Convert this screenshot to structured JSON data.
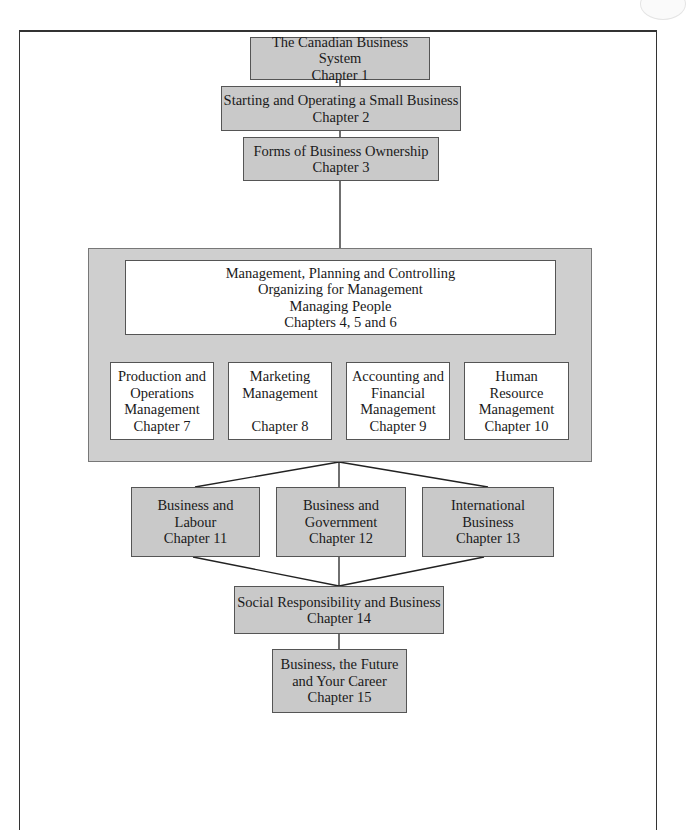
{
  "diagram": {
    "type": "flowchart",
    "nodes": [
      {
        "id": "ch1",
        "lines": [
          "The Canadian Business System",
          "Chapter 1"
        ]
      },
      {
        "id": "ch2",
        "lines": [
          "Starting and Operating a Small Business",
          "Chapter 2"
        ]
      },
      {
        "id": "ch3",
        "lines": [
          "Forms of Business Ownership",
          "Chapter 3"
        ]
      },
      {
        "id": "ch456",
        "lines": [
          "Management, Planning and Controlling",
          "Organizing for Management",
          "Managing People",
          "Chapters 4, 5 and 6"
        ]
      },
      {
        "id": "ch7",
        "lines": [
          "Production and",
          "Operations",
          "Management",
          "Chapter 7"
        ]
      },
      {
        "id": "ch8",
        "lines": [
          "Marketing",
          "Management",
          "",
          "Chapter 8"
        ]
      },
      {
        "id": "ch9",
        "lines": [
          "Accounting and",
          "Financial",
          "Management",
          "Chapter 9"
        ]
      },
      {
        "id": "ch10",
        "lines": [
          "Human",
          "Resource",
          "Management",
          "Chapter 10"
        ]
      },
      {
        "id": "ch11",
        "lines": [
          "Business and",
          "Labour",
          "Chapter 11"
        ]
      },
      {
        "id": "ch12",
        "lines": [
          "Business and",
          "Government",
          "Chapter 12"
        ]
      },
      {
        "id": "ch13",
        "lines": [
          "International",
          "Business",
          "Chapter 13"
        ]
      },
      {
        "id": "ch14",
        "lines": [
          "Social Responsibility and Business",
          "Chapter 14"
        ]
      },
      {
        "id": "ch15",
        "lines": [
          "Business, the Future",
          "and Your Career",
          "Chapter 15"
        ]
      }
    ],
    "edges": [
      [
        "ch1",
        "ch2"
      ],
      [
        "ch2",
        "ch3"
      ],
      [
        "ch3",
        "ch456"
      ],
      [
        "ch456",
        "ch7"
      ],
      [
        "ch456",
        "ch8"
      ],
      [
        "ch456",
        "ch9"
      ],
      [
        "ch456",
        "ch10"
      ],
      [
        "ch456",
        "ch11"
      ],
      [
        "ch456",
        "ch12"
      ],
      [
        "ch456",
        "ch13"
      ],
      [
        "ch11",
        "ch14"
      ],
      [
        "ch12",
        "ch14"
      ],
      [
        "ch13",
        "ch14"
      ],
      [
        "ch14",
        "ch15"
      ]
    ],
    "colors": {
      "gray_box": "#c9c9c9",
      "panel": "#cfcfcf",
      "white_box": "#ffffff",
      "line": "#222222"
    }
  }
}
